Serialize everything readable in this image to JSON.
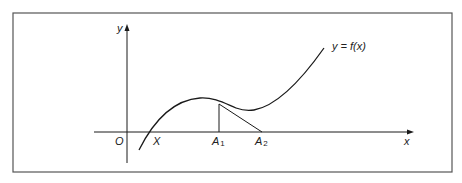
{
  "figure": {
    "curve_label": "y = f(x)",
    "axis_labels": {
      "y": "y",
      "x": "x",
      "origin": "O"
    },
    "points": [
      {
        "id": "X",
        "label": "X",
        "sub": ""
      },
      {
        "id": "A1",
        "label": "A",
        "sub": "1"
      },
      {
        "id": "A2",
        "label": "A",
        "sub": "2"
      }
    ],
    "colors": {
      "line": "#1a1a1a",
      "frame": "#555555",
      "background": "#ffffff"
    }
  }
}
